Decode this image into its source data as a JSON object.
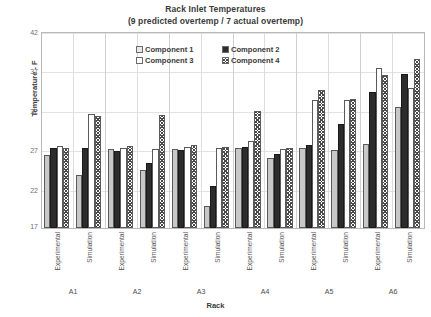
{
  "chart": {
    "title": "Rack Inlet Temperatures",
    "subtitle": "(9 predicted overtemp / 7 actual overtemp)",
    "ylabel": "Temperature - F",
    "xlabel": "Rack"
  },
  "legend": {
    "items": [
      {
        "label": "Component 1",
        "swatch": "light-gray-fill",
        "color": "#c8c8c8"
      },
      {
        "label": "Component 2",
        "swatch": "black-fill",
        "color": "#2c2c2c"
      },
      {
        "label": "Component 3",
        "swatch": "white-fill",
        "color": "#ffffff"
      },
      {
        "label": "Component 4",
        "swatch": "crosshatch-fill",
        "color": "#4a4a4a"
      }
    ]
  },
  "yaxis": {
    "ticks": [
      17,
      22,
      27,
      32,
      37,
      42
    ],
    "min": 17,
    "max": 42
  },
  "xaxis": {
    "condition_labels": [
      "Experimental",
      "Simulation",
      "Experimental",
      "Simulation",
      "Experimental",
      "Simulation",
      "Experimental",
      "Simulation",
      "Experimental",
      "Simulation",
      "Experimental",
      "Simulation"
    ],
    "racks": [
      "A1",
      "A2",
      "A3",
      "A4",
      "A5",
      "A6"
    ]
  },
  "chart_data": {
    "type": "bar",
    "title": "Rack Inlet Temperatures",
    "subtitle": "(9 predicted overtemp / 7 actual overtemp)",
    "xlabel": "Rack",
    "ylabel": "Temperature - F",
    "ylim": [
      17,
      42
    ],
    "yticks": [
      17,
      22,
      27,
      32,
      37,
      42
    ],
    "grid": true,
    "legend_position": "top-center-inside",
    "categories": [
      "A1 Experimental",
      "A1 Simulation",
      "A2 Experimental",
      "A2 Simulation",
      "A3 Experimental",
      "A3 Simulation",
      "A4 Experimental",
      "A4 Simulation",
      "A5 Experimental",
      "A5 Simulation",
      "A6 Experimental",
      "A6 Simulation"
    ],
    "group_labels": [
      "A1",
      "A2",
      "A3",
      "A4",
      "A5",
      "A6"
    ],
    "condition_labels": [
      "Experimental",
      "Simulation"
    ],
    "series": [
      {
        "name": "Component 1",
        "fill": "light-gray",
        "values": [
          26.3,
          23.7,
          27.0,
          24.3,
          27.0,
          19.8,
          27.2,
          25.9,
          27.1,
          26.9,
          27.7,
          32.4
        ]
      },
      {
        "name": "Component 2",
        "fill": "solid-black",
        "values": [
          27.1,
          27.2,
          26.8,
          25.2,
          26.9,
          22.3,
          27.3,
          26.4,
          27.5,
          30.2,
          34.2,
          36.5
        ]
      },
      {
        "name": "Component 3",
        "fill": "white",
        "values": [
          27.4,
          31.5,
          27.2,
          27.0,
          27.3,
          27.2,
          28.0,
          27.0,
          33.2,
          33.3,
          37.3,
          34.8
        ]
      },
      {
        "name": "Component 4",
        "fill": "crosshatch",
        "values": [
          27.2,
          31.2,
          27.4,
          31.3,
          27.5,
          27.3,
          31.9,
          27.2,
          34.5,
          33.4,
          36.4,
          38.5
        ]
      }
    ]
  }
}
